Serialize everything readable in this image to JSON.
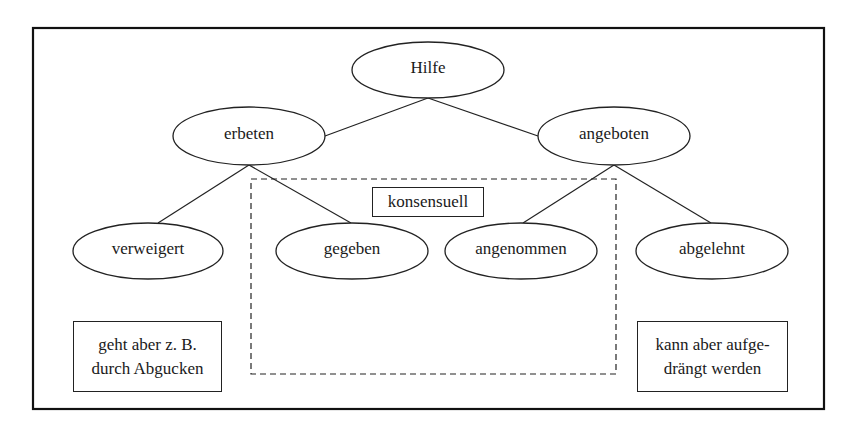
{
  "diagram": {
    "root": {
      "label": "Hilfe"
    },
    "level1": [
      {
        "id": "erbeten",
        "label": "erbeten"
      },
      {
        "id": "angeboten",
        "label": "angeboten"
      }
    ],
    "level2": [
      {
        "id": "verweigert",
        "label": "verweigert",
        "parent": "erbeten"
      },
      {
        "id": "gegeben",
        "label": "gegeben",
        "parent": "erbeten"
      },
      {
        "id": "angenommen",
        "label": "angenommen",
        "parent": "angeboten"
      },
      {
        "id": "abgelehnt",
        "label": "abgelehnt",
        "parent": "angeboten"
      }
    ],
    "group": {
      "label": "konsensuell",
      "members": [
        "gegeben",
        "angenommen"
      ]
    },
    "notes": [
      {
        "attached_to": "verweigert",
        "line1": "geht aber z. B.",
        "line2": "durch Abgucken"
      },
      {
        "attached_to": "abgelehnt",
        "line1": "kann aber aufge-",
        "line2": "drängt werden"
      }
    ]
  }
}
